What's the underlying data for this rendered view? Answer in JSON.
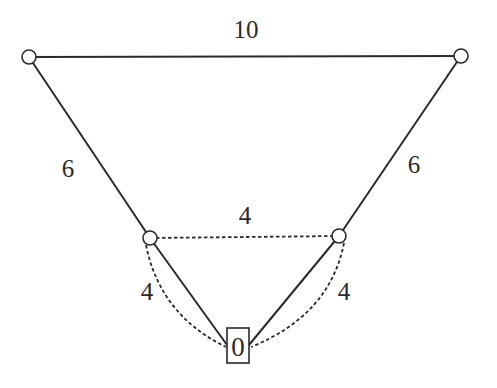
{
  "diagram": {
    "type": "weighted-graph",
    "nodes": [
      {
        "id": "top-left",
        "shape": "circle",
        "label": ""
      },
      {
        "id": "top-right",
        "shape": "circle",
        "label": ""
      },
      {
        "id": "mid-left",
        "shape": "circle",
        "label": ""
      },
      {
        "id": "mid-right",
        "shape": "circle",
        "label": ""
      },
      {
        "id": "root",
        "shape": "square",
        "label": "0"
      }
    ],
    "edges": [
      {
        "from": "top-left",
        "to": "top-right",
        "style": "solid",
        "weight": "10"
      },
      {
        "from": "top-left",
        "to": "mid-left",
        "style": "solid",
        "weight": "6"
      },
      {
        "from": "top-right",
        "to": "mid-right",
        "style": "solid",
        "weight": "6"
      },
      {
        "from": "mid-left",
        "to": "mid-right",
        "style": "dashed",
        "weight": "4"
      },
      {
        "from": "mid-left",
        "to": "root",
        "style": "solid",
        "weight": ""
      },
      {
        "from": "mid-right",
        "to": "root",
        "style": "solid",
        "weight": ""
      },
      {
        "from": "mid-left",
        "to": "root",
        "style": "dashed-curve",
        "weight": "4"
      },
      {
        "from": "mid-right",
        "to": "root",
        "style": "dashed-curve",
        "weight": "4"
      }
    ],
    "labels": {
      "top_edge": "10",
      "left_upper_edge": "6",
      "right_upper_edge": "6",
      "middle_dashed_edge": "4",
      "left_lower_dashed_edge": "4",
      "right_lower_dashed_edge": "4",
      "root_node": "0"
    },
    "colors": {
      "stroke": "#2a2a2a",
      "background": "#ffffff"
    }
  }
}
